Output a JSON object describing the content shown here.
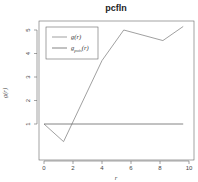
{
  "chart_data": {
    "type": "line",
    "title": "pcfln",
    "xlabel": "r",
    "ylabel": "g(r)",
    "xlim": [
      0,
      10
    ],
    "ylim": [
      0,
      5.3
    ],
    "xticks": [
      0,
      2,
      4,
      6,
      8,
      10
    ],
    "yticks": [
      1,
      2,
      3,
      4,
      5
    ],
    "grid": false,
    "legend_position": "top-left",
    "series": [
      {
        "name": "g(r)",
        "legend_label": "g(r)",
        "color": "#888888",
        "x": [
          0,
          1.35,
          4.0,
          5.5,
          8.2,
          9.6
        ],
        "y": [
          1.0,
          0.25,
          3.7,
          5.0,
          4.55,
          5.15
        ]
      },
      {
        "name": "g_pois(r)",
        "legend_label": "g",
        "legend_sub": "pois",
        "legend_suffix": "(r)",
        "color": "#666666",
        "x": [
          0,
          9.6
        ],
        "y": [
          1.0,
          1.0
        ]
      }
    ]
  },
  "colors": {
    "axis": "#555555",
    "text": "#333333"
  }
}
